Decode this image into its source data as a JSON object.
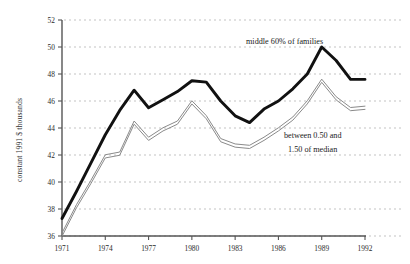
{
  "chart_data": {
    "type": "line",
    "title": "",
    "xlabel": "",
    "ylabel": "constant 1991 $ thousands",
    "xlim": [
      1971,
      1992
    ],
    "ylim": [
      36,
      52
    ],
    "yticks": [
      36,
      38,
      40,
      42,
      44,
      46,
      48,
      50,
      52
    ],
    "xticks": [
      1971,
      1974,
      1977,
      1980,
      1983,
      1986,
      1989,
      1992
    ],
    "grid": "horizontal-dashed",
    "legend": "inline-annotations",
    "x": [
      1971,
      1972,
      1973,
      1974,
      1975,
      1976,
      1977,
      1978,
      1979,
      1980,
      1981,
      1982,
      1983,
      1984,
      1985,
      1986,
      1987,
      1988,
      1989,
      1990,
      1991,
      1992
    ],
    "series": [
      {
        "name": "middle 60% of families",
        "style": "thick-black",
        "values": [
          37.3,
          39.3,
          41.4,
          43.5,
          45.3,
          46.8,
          45.5,
          46.1,
          46.7,
          47.5,
          47.4,
          46.0,
          44.9,
          44.4,
          45.4,
          46.0,
          46.9,
          48.0,
          50.0,
          49.0,
          47.6,
          47.6
        ]
      },
      {
        "name": "between 0.50 and 1.50 of median",
        "style": "thin-double-gray",
        "values": [
          36.1,
          38.2,
          40.0,
          41.9,
          42.1,
          44.4,
          43.2,
          43.9,
          44.4,
          45.9,
          44.8,
          43.1,
          42.7,
          42.6,
          43.2,
          43.9,
          44.7,
          45.9,
          47.5,
          46.2,
          45.4,
          45.5
        ]
      }
    ],
    "annotations": [
      {
        "name": "middle-60-label",
        "text": "middle 60% of families",
        "x_px": 246,
        "y_px": 44
      },
      {
        "name": "between-median-label-line1",
        "text": "between 0.50 and",
        "x_px": 284,
        "y_px": 138
      },
      {
        "name": "between-median-label-line2",
        "text": "1.50 of median",
        "x_px": 288,
        "y_px": 152
      }
    ],
    "colors": {
      "thick_series": "#111111",
      "thin_series": "#8a8a8a",
      "gridline": "#a9a9a9",
      "axis": "#555555",
      "background": "#ffffff",
      "text": "#1a1a1a"
    }
  }
}
